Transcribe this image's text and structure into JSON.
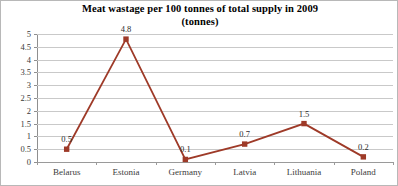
{
  "chart_data": {
    "type": "line",
    "title": "Meat wastage per 100 tonnes of total supply in 2009",
    "subtitle": "(tonnes)",
    "xlabel": "",
    "ylabel": "",
    "categories": [
      "Belarus",
      "Estonia",
      "Germany",
      "Latvia",
      "Lithuania",
      "Poland"
    ],
    "values": [
      0.5,
      4.8,
      0.1,
      0.7,
      1.5,
      0.2
    ],
    "data_labels": [
      "0.5",
      "4.8",
      "0.1",
      "0.7",
      "1.5",
      "0.2"
    ],
    "ylim": [
      0,
      5
    ],
    "ytick_labels": [
      "0",
      "0.5",
      "1",
      "1.5",
      "2",
      "2.5",
      "3",
      "3.5",
      "4",
      "4.5",
      "5"
    ],
    "ytick_values": [
      0,
      0.5,
      1,
      1.5,
      2,
      2.5,
      3,
      3.5,
      4,
      4.5,
      5
    ],
    "grid": true,
    "legend": false,
    "legend_position": "none",
    "series_color": "#9e3a28",
    "marker": "square",
    "gridline_color": "#c9c9c9",
    "axis_color": "#8f8f8f",
    "background_color": "#ffffff",
    "border_color": "#b8b8b8"
  }
}
